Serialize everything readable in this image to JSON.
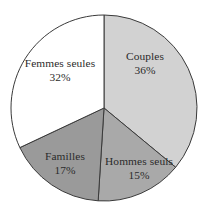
{
  "chart_data": {
    "type": "pie",
    "title": "",
    "subtitle": "",
    "xlabel": "",
    "ylabel": "",
    "legend_position": "none",
    "grid": false,
    "labels_on_slices": true,
    "value_suffix": "%",
    "categories": [
      "Couples",
      "Hommes seuls",
      "Familles",
      "Femmes seules"
    ],
    "values": [
      36,
      15,
      17,
      32
    ],
    "slices": [
      {
        "label": "Couples",
        "value": 36,
        "value_text": "36%",
        "color": "#d2d2d2",
        "start_angle_deg": 0,
        "end_angle_deg": 129.6
      },
      {
        "label": "Hommes seuls",
        "value": 15,
        "value_text": "15%",
        "color": "#a9a9a9",
        "start_angle_deg": 129.6,
        "end_angle_deg": 183.6
      },
      {
        "label": "Familles",
        "value": 17,
        "value_text": "17%",
        "color": "#9a9a9a",
        "start_angle_deg": 183.6,
        "end_angle_deg": 244.8
      },
      {
        "label": "Femmes seules",
        "value": 32,
        "value_text": "32%",
        "color": "#ffffff",
        "start_angle_deg": 244.8,
        "end_angle_deg": 360
      }
    ],
    "geometry": {
      "center_x": 104,
      "center_y": 108,
      "radius": 93,
      "start_at_twelve_oclock": true,
      "direction": "clockwise"
    },
    "style": {
      "background": "#ffffff",
      "outline_color": "#3a3a3a",
      "outline_width": 1,
      "label_color": "#2b2b2b"
    }
  }
}
